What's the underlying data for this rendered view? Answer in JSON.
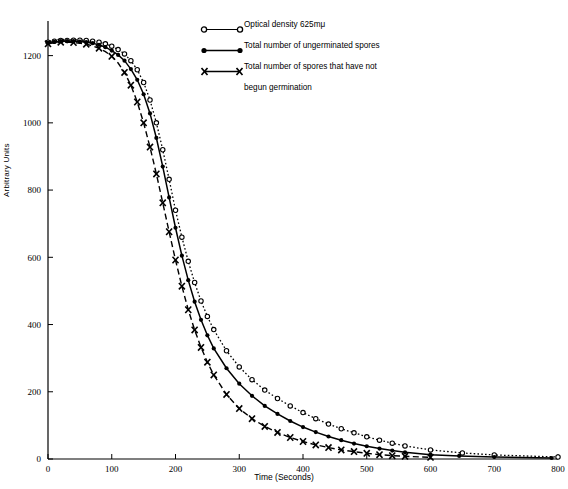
{
  "chart_data": {
    "type": "line",
    "title": "",
    "xlabel": "Time (Seconds)",
    "ylabel": "Arbitrary Units",
    "xlim": [
      0,
      800
    ],
    "ylim": [
      0,
      1300
    ],
    "xticks": [
      0,
      100,
      200,
      300,
      400,
      500,
      600,
      700,
      800
    ],
    "yticks": [
      0,
      200,
      400,
      600,
      800,
      1000,
      1200
    ],
    "grid": false,
    "legend_position": "top-center",
    "series": [
      {
        "name": "Optical density   625mμ",
        "marker": "open-circle",
        "linestyle": "dotted",
        "x": [
          0,
          10,
          20,
          30,
          40,
          50,
          60,
          70,
          80,
          90,
          100,
          110,
          120,
          130,
          140,
          150,
          160,
          170,
          180,
          190,
          200,
          210,
          220,
          230,
          240,
          250,
          260,
          280,
          300,
          320,
          340,
          360,
          380,
          400,
          420,
          440,
          460,
          480,
          500,
          520,
          540,
          560,
          600,
          650,
          700,
          800
        ],
        "y": [
          1240,
          1243,
          1245,
          1245,
          1246,
          1246,
          1245,
          1243,
          1240,
          1235,
          1228,
          1218,
          1205,
          1185,
          1158,
          1120,
          1068,
          1000,
          920,
          832,
          740,
          660,
          588,
          525,
          470,
          424,
          385,
          322,
          274,
          236,
          205,
          180,
          158,
          138,
          120,
          104,
          90,
          78,
          66,
          56,
          47,
          39,
          27,
          18,
          12,
          6
        ]
      },
      {
        "name": "Total number of ungerminated spores",
        "marker": "filled-circle",
        "linestyle": "solid",
        "x": [
          0,
          10,
          20,
          30,
          40,
          50,
          60,
          70,
          80,
          90,
          100,
          110,
          120,
          130,
          140,
          150,
          160,
          170,
          180,
          190,
          200,
          210,
          220,
          230,
          240,
          250,
          260,
          280,
          300,
          320,
          340,
          360,
          380,
          400,
          420,
          440,
          460,
          480,
          500,
          520,
          540,
          560,
          600,
          645,
          700,
          790
        ],
        "y": [
          1238,
          1241,
          1243,
          1243,
          1243,
          1242,
          1240,
          1237,
          1232,
          1225,
          1215,
          1202,
          1185,
          1160,
          1128,
          1085,
          1028,
          955,
          870,
          778,
          688,
          605,
          532,
          468,
          414,
          368,
          329,
          270,
          224,
          188,
          158,
          134,
          113,
          95,
          80,
          67,
          56,
          46,
          38,
          31,
          25,
          20,
          13,
          9,
          6,
          3
        ]
      },
      {
        "name": "Total number of spores that have not\n        begun germination",
        "marker": "x",
        "linestyle": "dashed",
        "x": [
          0,
          10,
          20,
          30,
          40,
          50,
          60,
          70,
          80,
          90,
          100,
          110,
          120,
          130,
          140,
          150,
          160,
          170,
          180,
          190,
          200,
          210,
          220,
          230,
          240,
          250,
          260,
          280,
          300,
          320,
          340,
          360,
          380,
          400,
          420,
          440,
          460,
          480,
          500,
          520,
          540,
          560,
          600
        ],
        "y": [
          1235,
          1238,
          1240,
          1240,
          1239,
          1237,
          1234,
          1229,
          1222,
          1212,
          1198,
          1178,
          1150,
          1112,
          1062,
          1000,
          928,
          848,
          762,
          676,
          592,
          514,
          444,
          384,
          332,
          288,
          250,
          192,
          150,
          120,
          97,
          79,
          64,
          52,
          42,
          34,
          27,
          22,
          17,
          13,
          10,
          8,
          5
        ]
      }
    ]
  },
  "legend": {
    "items": [
      {
        "label": "Optical density   625mμ",
        "marker": "open-circle"
      },
      {
        "label": "Total number of ungerminated spores",
        "marker": "filled-circle"
      },
      {
        "label": "Total number of spores that have not",
        "label2": "begun germination",
        "marker": "x"
      }
    ]
  },
  "axes": {
    "x_title": "Time (Seconds)",
    "y_title": "Arbitrary Units",
    "x_tick_labels": [
      "0",
      "100",
      "200",
      "300",
      "400",
      "500",
      "600",
      "700",
      "800"
    ],
    "y_tick_labels": [
      "0",
      "200",
      "400",
      "600",
      "800",
      "1000",
      "1200"
    ]
  },
  "colors": {
    "ink": "#000000",
    "background": "#ffffff"
  }
}
